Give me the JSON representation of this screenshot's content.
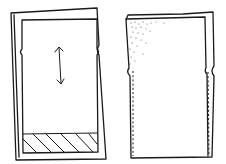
{
  "diagram": {
    "style": "hand-drawn sketch",
    "colors": {
      "ink": "#1a1a1a",
      "background": "#ffffff"
    },
    "panels": [
      {
        "id": "left-panel",
        "description": "frame with inner screen, vertical double-headed scroll arrow, side notches, hatched footer band",
        "elements": [
          "outer-frame",
          "inner-screen",
          "side-notches",
          "scroll-arrow-vertical",
          "hatched-footer"
        ]
      },
      {
        "id": "right-panel",
        "description": "frame with stippled top-left corner gradient, side notches, dashed vertical guides along both sides",
        "elements": [
          "outer-frame",
          "stipple-shading",
          "side-notches",
          "dashed-guide-left",
          "dashed-guide-right"
        ]
      }
    ]
  }
}
